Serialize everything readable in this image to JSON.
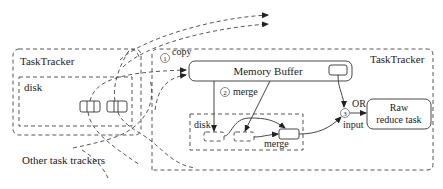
{
  "diagram": {
    "left_tracker": {
      "title": "TaskTracker",
      "disk_label": "disk"
    },
    "right_tracker": {
      "title": "TaskTracker",
      "memory_buffer_label": "Memory Buffer",
      "local_disk_label": "disk",
      "raw_reduce_task_line1": "Raw",
      "raw_reduce_task_line2": "reduce task"
    },
    "steps": [
      {
        "number": "1",
        "label": "copy"
      },
      {
        "number": "2",
        "label": "merge"
      },
      {
        "number": "3",
        "label": "input"
      }
    ],
    "inner_merge_label": "merge",
    "or_label": "OR",
    "other_trackers_label": "Other task trackers",
    "colors": {
      "stroke": "#333333",
      "background": "#ffffff"
    }
  }
}
